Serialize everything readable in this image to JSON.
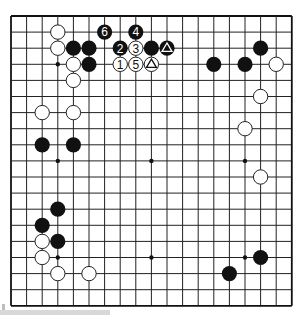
{
  "board": {
    "size": 19,
    "origin_x": 11,
    "origin_y": 16,
    "spacing_x": 15.6,
    "spacing_y": 16.1,
    "line_color": "#222222",
    "border_color": "#111111",
    "black_color": "#111111",
    "white_fill": "#ffffff",
    "white_stroke": "#222222",
    "star_points": [
      [
        3,
        3
      ],
      [
        9,
        3
      ],
      [
        15,
        3
      ],
      [
        3,
        9
      ],
      [
        9,
        9
      ],
      [
        15,
        9
      ],
      [
        3,
        15
      ],
      [
        9,
        15
      ],
      [
        15,
        15
      ]
    ]
  },
  "stones": [
    {
      "color": "white",
      "col": 3,
      "row": 1
    },
    {
      "color": "white",
      "col": 3,
      "row": 2
    },
    {
      "color": "black",
      "col": 4,
      "row": 2
    },
    {
      "color": "black",
      "col": 5,
      "row": 2
    },
    {
      "color": "white",
      "col": 4,
      "row": 3
    },
    {
      "color": "black",
      "col": 5,
      "row": 3
    },
    {
      "color": "white",
      "col": 4,
      "row": 4
    },
    {
      "color": "black",
      "col": 6,
      "row": 1,
      "label": "6"
    },
    {
      "color": "black",
      "col": 8,
      "row": 1,
      "label": "4"
    },
    {
      "color": "black",
      "col": 7,
      "row": 2,
      "label": "2"
    },
    {
      "color": "white",
      "col": 8,
      "row": 2,
      "label": "3"
    },
    {
      "color": "black",
      "col": 9,
      "row": 2
    },
    {
      "color": "black",
      "col": 10,
      "row": 2,
      "mark": "triangle"
    },
    {
      "color": "white",
      "col": 7,
      "row": 3,
      "label": "1"
    },
    {
      "color": "white",
      "col": 8,
      "row": 3,
      "label": "5"
    },
    {
      "color": "white",
      "col": 9,
      "row": 3,
      "mark": "triangle"
    },
    {
      "color": "black",
      "col": 16,
      "row": 2
    },
    {
      "color": "black",
      "col": 13,
      "row": 3
    },
    {
      "color": "black",
      "col": 15,
      "row": 3
    },
    {
      "color": "white",
      "col": 17,
      "row": 3
    },
    {
      "color": "white",
      "col": 16,
      "row": 5
    },
    {
      "color": "white",
      "col": 15,
      "row": 7
    },
    {
      "color": "white",
      "col": 16,
      "row": 10
    },
    {
      "color": "white",
      "col": 2,
      "row": 6
    },
    {
      "color": "white",
      "col": 4,
      "row": 6
    },
    {
      "color": "black",
      "col": 2,
      "row": 8
    },
    {
      "color": "black",
      "col": 4,
      "row": 8
    },
    {
      "color": "black",
      "col": 3,
      "row": 12
    },
    {
      "color": "black",
      "col": 2,
      "row": 13
    },
    {
      "color": "white",
      "col": 2,
      "row": 14
    },
    {
      "color": "black",
      "col": 3,
      "row": 14
    },
    {
      "color": "white",
      "col": 2,
      "row": 15
    },
    {
      "color": "white",
      "col": 3,
      "row": 16
    },
    {
      "color": "white",
      "col": 5,
      "row": 16
    },
    {
      "color": "black",
      "col": 16,
      "row": 15
    },
    {
      "color": "black",
      "col": 14,
      "row": 16
    }
  ]
}
